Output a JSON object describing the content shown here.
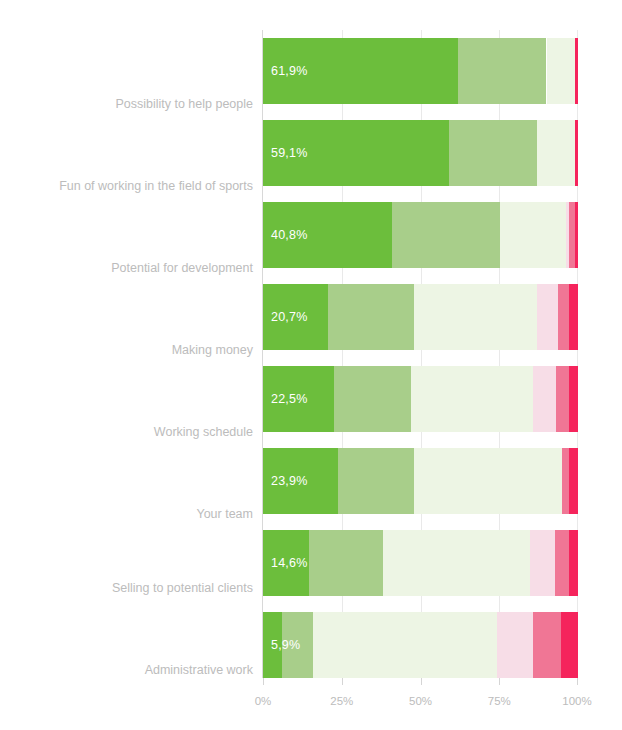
{
  "chart_data": {
    "type": "bar",
    "subtype": "stacked-horizontal-100pct",
    "title": "",
    "subtitle": "",
    "xlabel": "",
    "ylabel": "",
    "xlim": [
      0,
      100
    ],
    "grid": true,
    "legend_position": "none",
    "x_ticks": [
      "0%",
      "25%",
      "50%",
      "75%",
      "100%"
    ],
    "x_tick_values": [
      0,
      25,
      50,
      75,
      100
    ],
    "categories": [
      "Possibility to help people",
      "Fun of working in the field of sports",
      "Potential for development",
      "Making money",
      "Working schedule",
      "Your team",
      "Selling to potential clients",
      "Administrative work"
    ],
    "series": [
      {
        "name": "very-satisfied",
        "color": "#6CBE3C",
        "values": [
          61.9,
          59.1,
          40.8,
          20.7,
          22.5,
          23.9,
          14.6,
          5.9
        ]
      },
      {
        "name": "satisfied",
        "color": "#A8CE8A",
        "values": [
          28.1,
          28.0,
          34.5,
          27.3,
          24.5,
          24.1,
          23.4,
          10.1
        ]
      },
      {
        "name": "neutral",
        "color": "#EDF5E4",
        "values": [
          9.0,
          11.9,
          20.8,
          38.9,
          38.8,
          47.0,
          46.8,
          58.3
        ]
      },
      {
        "name": "dissatisfied",
        "color": "#F7DDE7",
        "values": [
          0.0,
          0.0,
          1.2,
          6.7,
          7.2,
          0.0,
          8.0,
          11.5
        ]
      },
      {
        "name": "very-dissatisfied",
        "color": "#F07695",
        "values": [
          0.0,
          0.0,
          1.6,
          3.4,
          4.1,
          2.1,
          4.3,
          8.9
        ]
      },
      {
        "name": "no-answer",
        "color": "#F5245C",
        "values": [
          1.0,
          1.0,
          1.1,
          3.0,
          2.9,
          2.9,
          2.9,
          5.3
        ]
      }
    ],
    "value_labels": [
      "61,9%",
      "59,1%",
      "40,8%",
      "20,7%",
      "22,5%",
      "23,9%",
      "14,6%",
      "5,9%"
    ]
  },
  "axis": {
    "tick_0": "0%",
    "tick_25": "25%",
    "tick_50": "50%",
    "tick_75": "75%",
    "tick_100": "100%"
  },
  "categories": {
    "c0": "Possibility to help people",
    "c1": "Fun of working in the field of sports",
    "c2": "Potential for development",
    "c3": "Making money",
    "c4": "Working schedule",
    "c5": "Your team",
    "c6": "Selling to potential clients",
    "c7": "Administrative work"
  },
  "values": {
    "v0": "61,9%",
    "v1": "59,1%",
    "v2": "40,8%",
    "v3": "20,7%",
    "v4": "22,5%",
    "v5": "23,9%",
    "v6": "14,6%",
    "v7": "5,9%"
  },
  "colors": {
    "very_satisfied": "#6CBE3C",
    "satisfied": "#A8CE8A",
    "neutral": "#EDF5E4",
    "dissatisfied": "#F7DDE7",
    "very_dissatisfied": "#F07695",
    "no_answer": "#F5245C",
    "grid": "#E9E9E9",
    "label_text": "#BCBCBC"
  }
}
